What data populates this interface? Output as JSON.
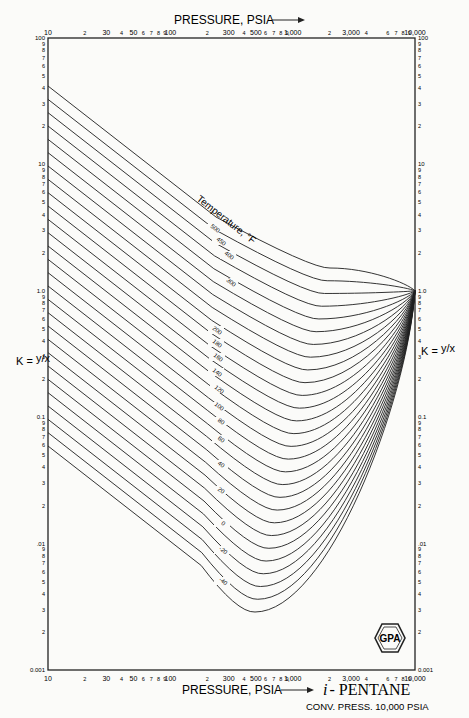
{
  "chart_data": {
    "type": "line",
    "subtitle": "CONV. PRESS. 10,000 PSIA",
    "xlabel": "PRESSURE, PSIA",
    "ylabel": "K = y/x",
    "x_scale": "log",
    "y_scale": "log",
    "xlim": [
      10,
      10000
    ],
    "ylim": [
      0.001,
      100
    ],
    "grid": false,
    "x_tick_labels": [
      "10",
      "2",
      "30",
      "4",
      "50",
      "6",
      "7",
      "8",
      "9",
      "100",
      "2",
      "300",
      "4",
      "500",
      "6",
      "7",
      "8",
      "9",
      "1,000",
      "2",
      "3,000",
      "4",
      "6",
      "7",
      "8",
      "9",
      "10,000"
    ],
    "y_tick_labels": [
      "100",
      "9",
      "8",
      "7",
      "6",
      "5",
      "4",
      "3",
      "2",
      "10",
      "9",
      "8",
      "7",
      "6",
      "5",
      "4",
      "3",
      "2",
      "1.0",
      "9",
      "8",
      "7",
      "6",
      "5",
      "4",
      "3",
      "2",
      "0.1",
      "9",
      "8",
      "7",
      "6",
      "5",
      "4",
      "3",
      "2",
      ".01",
      "9",
      "8",
      "7",
      "6",
      "5",
      "4",
      "3",
      "2",
      "0.001"
    ],
    "legend_title": "Temperature, °F",
    "convergence_point": {
      "pressure_psia": 10000,
      "K": 1.0
    },
    "series": [
      {
        "name": "500",
        "x": [
          10,
          20,
          50,
          100,
          200,
          500,
          1000,
          2000,
          5000,
          10000
        ],
        "K": [
          4.5,
          2.6,
          1.3,
          0.85,
          0.65,
          0.62,
          0.66,
          0.74,
          0.88,
          1.0
        ]
      },
      {
        "name": "480",
        "x": [
          10,
          20,
          50,
          100,
          200,
          500,
          1000,
          2000,
          5000,
          10000
        ],
        "K": [
          3.9,
          2.3,
          1.15,
          0.75,
          0.57,
          0.53,
          0.57,
          0.66,
          0.84,
          1.0
        ]
      },
      {
        "name": "460",
        "x": [
          10,
          20,
          50,
          100,
          200,
          500,
          1000,
          2000,
          5000,
          10000
        ],
        "K": [
          3.4,
          2.0,
          1.0,
          0.66,
          0.5,
          0.46,
          0.5,
          0.6,
          0.8,
          1.0
        ]
      },
      {
        "name": "440",
        "x": [
          10,
          20,
          50,
          100,
          200,
          500,
          1000,
          2000,
          5000,
          10000
        ],
        "K": [
          2.9,
          1.75,
          0.88,
          0.58,
          0.44,
          0.4,
          0.44,
          0.54,
          0.77,
          1.0
        ]
      },
      {
        "name": "420",
        "x": [
          10,
          20,
          50,
          100,
          200,
          500,
          1000,
          2000,
          5000,
          10000
        ],
        "K": [
          2.55,
          1.5,
          0.77,
          0.5,
          0.38,
          0.34,
          0.38,
          0.48,
          0.74,
          1.0
        ]
      },
      {
        "name": "400",
        "x": [
          10,
          20,
          50,
          100,
          200,
          500,
          1000,
          2000,
          5000,
          10000
        ],
        "K": [
          2.2,
          1.3,
          0.66,
          0.43,
          0.32,
          0.29,
          0.33,
          0.43,
          0.71,
          1.0
        ]
      },
      {
        "name": "380",
        "x": [
          10,
          20,
          50,
          100,
          200,
          500,
          1000,
          2000,
          5000,
          10000
        ],
        "K": [
          1.9,
          1.12,
          0.57,
          0.37,
          0.27,
          0.25,
          0.28,
          0.38,
          0.68,
          1.0
        ]
      },
      {
        "name": "360",
        "x": [
          10,
          20,
          50,
          100,
          200,
          500,
          1000,
          2000,
          5000,
          10000
        ],
        "K": [
          1.6,
          0.95,
          0.48,
          0.31,
          0.23,
          0.21,
          0.24,
          0.34,
          0.65,
          1.0
        ]
      },
      {
        "name": "340",
        "x": [
          10,
          20,
          50,
          100,
          200,
          500,
          1000,
          2000,
          5000,
          10000
        ],
        "K": [
          1.35,
          0.8,
          0.41,
          0.26,
          0.19,
          0.17,
          0.2,
          0.3,
          0.62,
          1.0
        ]
      },
      {
        "name": "320",
        "x": [
          10,
          20,
          50,
          100,
          200,
          500,
          1000,
          2000,
          5000,
          10000
        ],
        "K": [
          1.15,
          0.68,
          0.34,
          0.22,
          0.16,
          0.14,
          0.17,
          0.26,
          0.6,
          1.0
        ]
      },
      {
        "name": "300",
        "x": [
          10,
          20,
          50,
          100,
          200,
          500,
          1000,
          2000,
          5000,
          10000
        ],
        "K": [
          0.95,
          0.56,
          0.28,
          0.18,
          0.13,
          0.115,
          0.14,
          0.22,
          0.57,
          1.0
        ]
      },
      {
        "name": "280",
        "x": [
          10,
          20,
          50,
          100,
          200,
          500,
          1000,
          2000,
          5000,
          10000
        ],
        "K": [
          0.78,
          0.46,
          0.23,
          0.15,
          0.105,
          0.093,
          0.115,
          0.19,
          0.54,
          1.0
        ]
      },
      {
        "name": "260",
        "x": [
          10,
          20,
          50,
          100,
          200,
          500,
          1000,
          2000,
          5000,
          10000
        ],
        "K": [
          0.64,
          0.38,
          0.19,
          0.12,
          0.085,
          0.075,
          0.093,
          0.16,
          0.51,
          1.0
        ]
      },
      {
        "name": "240",
        "x": [
          10,
          20,
          50,
          100,
          200,
          500,
          1000,
          2000,
          5000,
          10000
        ],
        "K": [
          0.52,
          0.31,
          0.155,
          0.098,
          0.069,
          0.06,
          0.076,
          0.135,
          0.48,
          1.0
        ]
      },
      {
        "name": "220",
        "x": [
          10,
          20,
          50,
          100,
          200,
          500,
          1000,
          2000,
          5000,
          10000
        ],
        "K": [
          0.42,
          0.25,
          0.125,
          0.079,
          0.055,
          0.048,
          0.061,
          0.115,
          0.46,
          1.0
        ]
      },
      {
        "name": "200",
        "x": [
          10,
          20,
          50,
          100,
          200,
          500,
          1000,
          2000,
          5000,
          10000
        ],
        "K": [
          0.34,
          0.2,
          0.1,
          0.063,
          0.044,
          0.038,
          0.049,
          0.097,
          0.44,
          1.0
        ]
      },
      {
        "name": "180",
        "x": [
          10,
          20,
          50,
          100,
          200,
          500,
          1000,
          2000,
          5000,
          10000
        ],
        "K": [
          0.27,
          0.16,
          0.08,
          0.05,
          0.035,
          0.03,
          0.039,
          0.082,
          0.42,
          1.0
        ]
      },
      {
        "name": "160",
        "x": [
          10,
          20,
          50,
          100,
          200,
          500,
          1000,
          2000,
          5000,
          10000
        ],
        "K": [
          0.21,
          0.125,
          0.063,
          0.04,
          0.028,
          0.024,
          0.031,
          0.07,
          0.4,
          1.0
        ]
      },
      {
        "name": "140",
        "x": [
          10,
          20,
          50,
          100,
          200,
          500,
          1000,
          2000,
          5000,
          10000
        ],
        "K": [
          0.16,
          0.095,
          0.049,
          0.031,
          0.022,
          0.019,
          0.025,
          0.059,
          0.38,
          1.0
        ]
      },
      {
        "name": "120",
        "x": [
          10,
          20,
          50,
          100,
          200,
          500,
          1000,
          2000,
          5000,
          10000
        ],
        "K": [
          0.12,
          0.072,
          0.037,
          0.024,
          0.017,
          0.0145,
          0.02,
          0.05,
          0.36,
          1.0
        ]
      },
      {
        "name": "100",
        "x": [
          10,
          20,
          50,
          100,
          200,
          500,
          1000,
          2000,
          5000,
          10000
        ],
        "K": [
          0.9,
          0.54,
          0.27,
          0.17,
          0.12,
          0.105,
          0.0135,
          0.042,
          0.34,
          1.0
        ]
      },
      {
        "name": "80",
        "x": [
          10,
          20,
          50,
          100,
          200,
          500,
          1000,
          2000,
          5000,
          10000
        ],
        "K": [
          0.6,
          0.36,
          0.18,
          0.115,
          0.08,
          0.07,
          0.0105,
          0.035,
          0.32,
          1.0
        ]
      },
      {
        "name": "60",
        "x": [
          10,
          20,
          50,
          100,
          200,
          500,
          1000,
          2000,
          5000,
          10000
        ],
        "K": [
          0.4,
          0.24,
          0.12,
          0.077,
          0.054,
          0.047,
          0.008,
          0.029,
          0.3,
          1.0
        ]
      },
      {
        "name": "40",
        "x": [
          10,
          20,
          50,
          100,
          200,
          500,
          1000,
          2000,
          5000,
          10000
        ],
        "K": [
          0.23,
          0.14,
          0.07,
          0.045,
          0.031,
          0.027,
          0.0058,
          0.024,
          0.28,
          1.0
        ]
      },
      {
        "name": "20",
        "x": [
          10,
          20,
          50,
          100,
          200,
          500,
          1000,
          2000,
          5000,
          10000
        ],
        "K": [
          0.12,
          0.072,
          0.036,
          0.023,
          0.016,
          0.014,
          0.004,
          0.019,
          0.26,
          1.0
        ]
      },
      {
        "name": "0",
        "x": [
          10,
          20,
          50,
          100,
          200,
          500,
          1000,
          2000,
          5000,
          10000
        ],
        "K": [
          0.065,
          0.039,
          0.02,
          0.0125,
          0.0088,
          0.0064,
          0.0027,
          0.015,
          0.24,
          1.0
        ]
      },
      {
        "name": "-20",
        "x": [
          10,
          20,
          50,
          100,
          200,
          500,
          1000,
          2000,
          5000,
          10000
        ],
        "K": [
          0.035,
          0.021,
          0.0105,
          0.0066,
          0.0046,
          0.0033,
          0.0018,
          0.012,
          0.22,
          1.0
        ]
      },
      {
        "name": "-40",
        "x": [
          10,
          20,
          50,
          100,
          200,
          500,
          1000,
          2000,
          5000,
          10000
        ],
        "K": [
          0.018,
          0.011,
          0.0055,
          0.0035,
          0.0024,
          0.0017,
          0.0012,
          0.0095,
          0.2,
          1.0
        ]
      }
    ],
    "curve_labels_visible": [
      "500",
      "450",
      "400",
      "300",
      "200",
      "180",
      "160",
      "140",
      "120",
      "100",
      "80",
      "60",
      "40",
      "20",
      "0",
      "-20",
      "-40"
    ]
  },
  "header": {
    "top_axis_title": "PRESSURE, PSIA",
    "arrow": "→"
  },
  "footer": {
    "bottom_axis_title": "PRESSURE, PSIA",
    "compound_prefix": "i",
    "compound_name": "- PENTANE",
    "conv_pressure": "CONV. PRESS. 10,000 PSIA"
  },
  "axes": {
    "left_label_k": "K = ",
    "left_label_frac": "y/x",
    "right_label_k": "K = ",
    "right_label_frac": "y/x",
    "legend_title": "Temperature, °F"
  },
  "logo": {
    "text": "GPA"
  }
}
